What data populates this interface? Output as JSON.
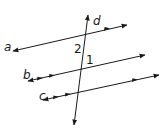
{
  "diagram": {
    "type": "parallel-lines-transversal",
    "lines": [
      {
        "id": "a",
        "label": "a",
        "parallel_marks": 1
      },
      {
        "id": "b",
        "label": "b",
        "parallel_marks": 2
      },
      {
        "id": "c",
        "label": "c",
        "parallel_marks": 2
      },
      {
        "id": "d",
        "label": "d",
        "role": "transversal"
      }
    ],
    "angles": [
      {
        "label": "2"
      },
      {
        "label": "1"
      }
    ],
    "colors": {
      "stroke": "#1a1a1a",
      "background": "#ffffff"
    }
  }
}
